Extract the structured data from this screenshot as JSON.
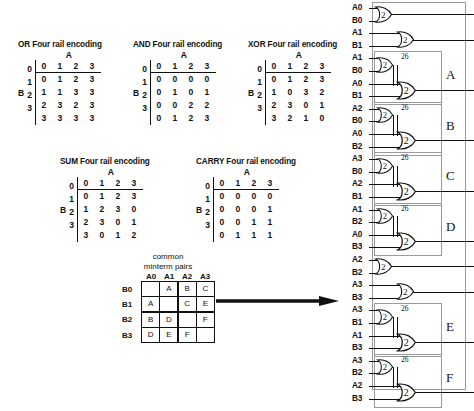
{
  "tables": [
    {
      "id": "or",
      "title": "OR Four rail encoding",
      "a_label": "A",
      "b_label": "B",
      "col_headers": [
        "0",
        "1",
        "2",
        "3"
      ],
      "row_headers": [
        "0",
        "1",
        "2",
        "3"
      ],
      "rows": [
        [
          "0",
          "1",
          "2",
          "3"
        ],
        [
          "1",
          "1",
          "3",
          "3"
        ],
        [
          "2",
          "3",
          "2",
          "3"
        ],
        [
          "3",
          "3",
          "3",
          "3"
        ]
      ]
    },
    {
      "id": "and",
      "title": "AND Four rail encoding",
      "a_label": "A",
      "b_label": "B",
      "col_headers": [
        "0",
        "1",
        "2",
        "3"
      ],
      "row_headers": [
        "0",
        "1",
        "2",
        "3"
      ],
      "rows": [
        [
          "0",
          "0",
          "0",
          "0"
        ],
        [
          "0",
          "1",
          "0",
          "1"
        ],
        [
          "0",
          "0",
          "2",
          "2"
        ],
        [
          "0",
          "1",
          "2",
          "3"
        ]
      ]
    },
    {
      "id": "xor",
      "title": "XOR Four rail encoding",
      "a_label": "A",
      "b_label": "B",
      "col_headers": [
        "0",
        "1",
        "2",
        "3"
      ],
      "row_headers": [
        "0",
        "1",
        "2",
        "3"
      ],
      "rows": [
        [
          "0",
          "1",
          "2",
          "3"
        ],
        [
          "1",
          "0",
          "3",
          "2"
        ],
        [
          "2",
          "3",
          "0",
          "1"
        ],
        [
          "3",
          "2",
          "1",
          "0"
        ]
      ]
    },
    {
      "id": "sum",
      "title": "SUM Four rail encoding",
      "a_label": "A",
      "b_label": "B",
      "col_headers": [
        "0",
        "1",
        "2",
        "3"
      ],
      "row_headers": [
        "0",
        "1",
        "2",
        "3"
      ],
      "rows": [
        [
          "0",
          "1",
          "2",
          "3"
        ],
        [
          "1",
          "2",
          "3",
          "0"
        ],
        [
          "2",
          "3",
          "0",
          "1"
        ],
        [
          "3",
          "0",
          "1",
          "2"
        ]
      ]
    },
    {
      "id": "carry",
      "title": "CARRY Four rail encoding",
      "a_label": "A",
      "b_label": "B",
      "col_headers": [
        "0",
        "1",
        "2",
        "3"
      ],
      "row_headers": [
        "0",
        "1",
        "2",
        "3"
      ],
      "rows": [
        [
          "0",
          "0",
          "0",
          "0"
        ],
        [
          "0",
          "0",
          "0",
          "1"
        ],
        [
          "0",
          "0",
          "1",
          "1"
        ],
        [
          "0",
          "1",
          "1",
          "1"
        ]
      ]
    }
  ],
  "minterm": {
    "title_line1": "common",
    "title_line2": "minterm pairs",
    "col_headers": [
      "A0",
      "A1",
      "A2",
      "A3"
    ],
    "row_headers": [
      "B0",
      "B1",
      "B2",
      "B3"
    ],
    "cells": [
      [
        "",
        "A",
        "B",
        "C"
      ],
      [
        "A",
        "",
        "C",
        "E"
      ],
      [
        "B",
        "D",
        "",
        "F"
      ],
      [
        "D",
        "E",
        "F",
        ""
      ]
    ]
  },
  "arrow": {
    "name": "implication-arrow"
  },
  "circuit": {
    "gate_threshold": "2",
    "block_number": "26",
    "input_labels": [
      "A0",
      "B0",
      "A1",
      "B1",
      "A1",
      "B0",
      "A0",
      "B1",
      "A2",
      "B0",
      "A0",
      "B2",
      "A3",
      "B0",
      "A2",
      "B1",
      "A1",
      "B2",
      "A0",
      "B3",
      "A2",
      "B2",
      "A3",
      "B3",
      "A3",
      "B1",
      "A1",
      "B3",
      "A3",
      "B2",
      "A2",
      "B3"
    ],
    "blocks": [
      {
        "label": "A",
        "number": "26",
        "inputs": [
          "A1",
          "B0",
          "A0",
          "B1"
        ]
      },
      {
        "label": "B",
        "number": "26",
        "inputs": [
          "A2",
          "B0",
          "A0",
          "B2"
        ]
      },
      {
        "label": "C",
        "number": "26",
        "inputs": [
          "A3",
          "B0",
          "A2",
          "B1"
        ]
      },
      {
        "label": "D",
        "number": "26",
        "inputs": [
          "A1",
          "B2",
          "A0",
          "B3"
        ]
      },
      {
        "label": "E",
        "number": "26",
        "inputs": [
          "A3",
          "B1",
          "A1",
          "B3"
        ]
      },
      {
        "label": "F",
        "number": "26",
        "inputs": [
          "A3",
          "B2",
          "A2",
          "B3"
        ]
      }
    ],
    "single_gates": [
      {
        "inputs": [
          "A0",
          "B0"
        ]
      },
      {
        "inputs": [
          "A1",
          "B1"
        ]
      },
      {
        "inputs": [
          "A2",
          "B2"
        ]
      },
      {
        "inputs": [
          "A3",
          "B3"
        ]
      }
    ]
  },
  "colors": {
    "ink": "#111111",
    "box_outline": "#9a9a9a",
    "background": "#ffffff"
  }
}
